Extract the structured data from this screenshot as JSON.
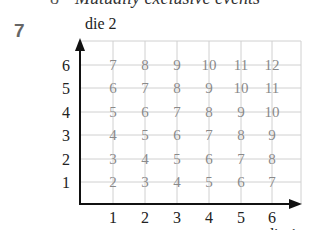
{
  "header": {
    "bullet": "8",
    "line_text": "Mutually exclusive events",
    "question_number": "7"
  },
  "chart_data": {
    "type": "table",
    "title": "",
    "xlabel": "die 1",
    "ylabel": "die 2",
    "x_ticks": [
      "1",
      "2",
      "3",
      "4",
      "5",
      "6"
    ],
    "y_ticks": [
      "1",
      "2",
      "3",
      "4",
      "5",
      "6"
    ],
    "grid": true,
    "rows": [
      {
        "die2": 6,
        "values": [
          7,
          8,
          9,
          10,
          11,
          12
        ]
      },
      {
        "die2": 5,
        "values": [
          6,
          7,
          8,
          9,
          10,
          11
        ]
      },
      {
        "die2": 4,
        "values": [
          5,
          6,
          7,
          8,
          9,
          10
        ]
      },
      {
        "die2": 3,
        "values": [
          4,
          5,
          6,
          7,
          8,
          9
        ]
      },
      {
        "die2": 2,
        "values": [
          3,
          4,
          5,
          6,
          7,
          8
        ]
      },
      {
        "die2": 1,
        "values": [
          2,
          3,
          4,
          5,
          6,
          7
        ]
      }
    ]
  }
}
